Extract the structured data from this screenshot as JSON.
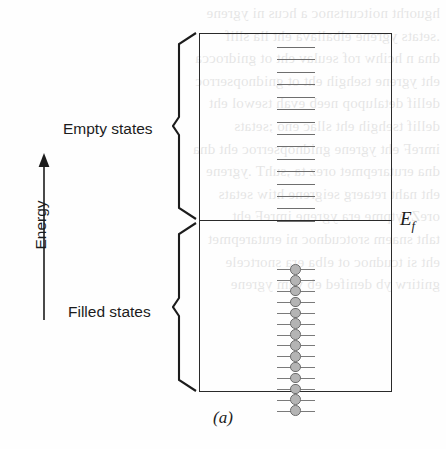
{
  "figure": {
    "caption": "(a)",
    "axis": {
      "label": "Energy",
      "direction": "up",
      "arrow_icon": "up-arrow-icon"
    },
    "regions": [
      {
        "key": "empty",
        "label": "Empty states",
        "brace_icon": "curly-brace-left-icon",
        "state_count": 15,
        "state_style": "dash",
        "state_color": "#6e6e6e"
      },
      {
        "key": "filled",
        "label": "Filled states",
        "brace_icon": "curly-brace-left-icon",
        "state_count": 14,
        "state_style": "dash-with-electron",
        "state_color": "#7a7a7a",
        "electron_fill": "#b4b4b4",
        "electron_stroke": "#6d6d6d"
      }
    ],
    "fermi_level": {
      "label_base": "E",
      "label_sub": "f",
      "line_color": "#2a2a2a"
    },
    "box": {
      "border_color": "#2a2a2a",
      "fill": "transparent"
    }
  },
  "background_bleed": {
    "lines": [
      "hguorht noitcurtsnoc a hcus ni ygrene",
      ".setats ygrene elbaliava eht lla sllif",
      "dna n hcihw rof seulav eht ot gnidrocca",
      "eht ygrene tsehgih eht ot gnidnopserroc",
      "dellif detalupop neeb evah tsewol eht",
      "dellif tsehgih eht sllac eno ;setats",
      "imreF eht ygrene gnidnopserroc eht dna",
      "dna erutarepmet orez ta ,suhT .ygrene",
      "eht naht retaerg seigrene htiw setats",
      "oreZ .ytpme era ygrene imreF eht",
      "taht snaem srotcudnoc ni erutarepmet",
      "eht si tcudnoc ot elba era snortcele",
      "gnitirw yb denifed eb yam ygrene"
    ]
  }
}
